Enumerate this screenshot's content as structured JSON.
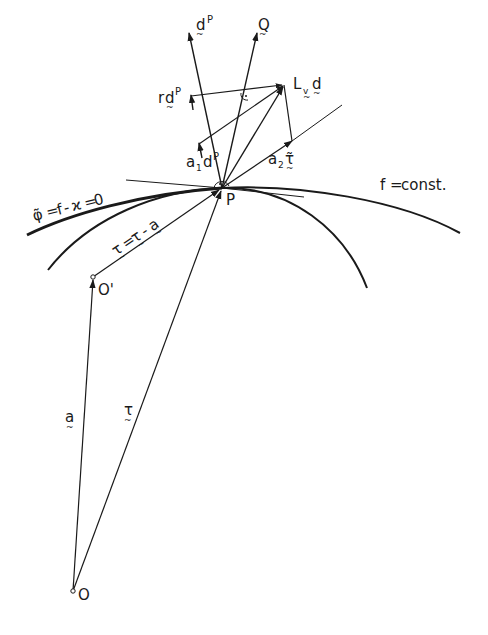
{
  "figure": {
    "background": "#ffffff",
    "ink": "#1a1a1a",
    "points": {
      "O": {
        "label": "O",
        "x": 73,
        "y": 591
      },
      "O_prime": {
        "label": "O'",
        "x": 93,
        "y": 277
      },
      "P": {
        "label": "P",
        "x": 222,
        "y": 188
      },
      "L": {
        "x": 284,
        "y": 85
      }
    },
    "vectors": {
      "a": {
        "label": "a",
        "from": "O",
        "to": "O'"
      },
      "t": {
        "label": "τ",
        "from": "O",
        "to": "P"
      },
      "t_prime": {
        "label": "τ' = τ - a",
        "main": "τ",
        "eq": "=",
        "rhs1": "τ",
        "minus": "-",
        "rhs2": "a",
        "from": "O'",
        "to": "P"
      },
      "dP": {
        "label": "d",
        "sup": "P"
      },
      "Q": {
        "label": "Q"
      },
      "r_dP": {
        "prefix": "r",
        "label": "d",
        "sup": "P"
      },
      "a1_dP": {
        "prefix": "a",
        "sub": "1",
        "label": "d",
        "sup": "P"
      },
      "Lvd": {
        "prefix": "L",
        "sub": "v",
        "label": "d"
      },
      "a2_t": {
        "prefix": "a",
        "sub": "2",
        "label": "τ̃"
      }
    },
    "curves": {
      "level_set": {
        "label": "φ̃ = f - ϰ = 0",
        "phi": "φ̃",
        "eq1": "=",
        "f": "f",
        "minus": "-",
        "kappa": "ϰ",
        "eq2": "=",
        "zero": "0"
      },
      "f_const": {
        "label": "f = const.",
        "f": "f",
        "eq": "=",
        "rhs": "const."
      }
    }
  }
}
